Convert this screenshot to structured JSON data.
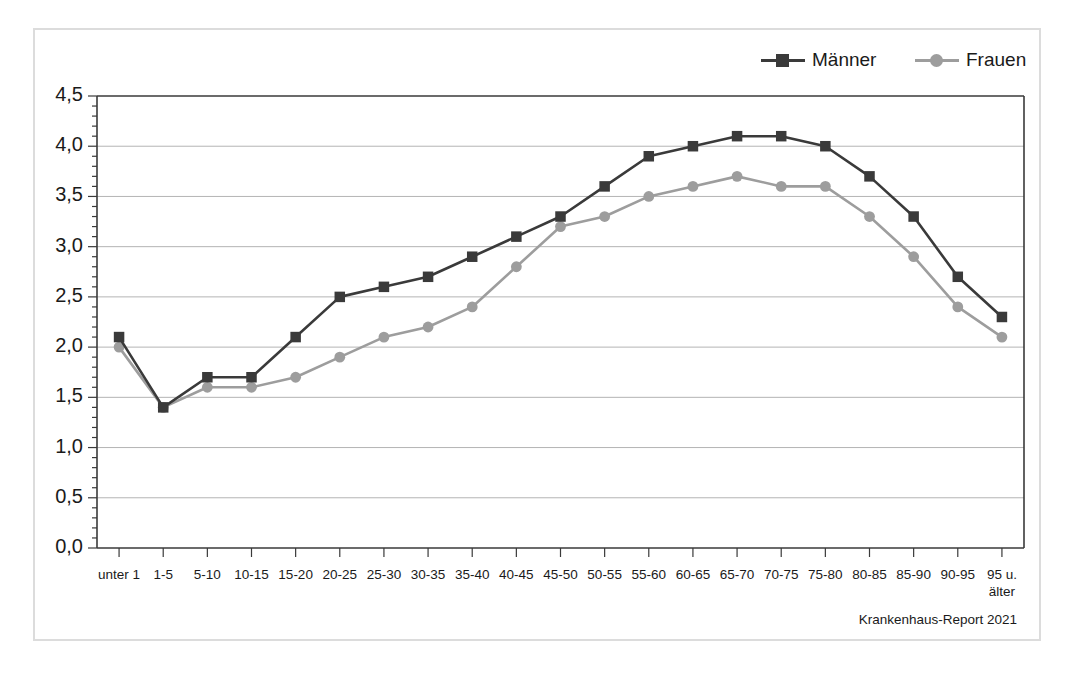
{
  "figure": {
    "source_note": "Krankenhaus-Report 2021"
  },
  "legend": {
    "entries": [
      {
        "label": "Männer",
        "color": "#3a3a3a",
        "marker": "square-marker"
      },
      {
        "label": "Frauen",
        "color": "#9d9d9d",
        "marker": "circle-marker"
      }
    ]
  },
  "chart_data": {
    "type": "line",
    "title": "",
    "subtitle": "",
    "xlabel": "",
    "ylabel": "",
    "ylim": [
      0.0,
      4.5
    ],
    "ytick_step": 0.5,
    "yticks": [
      "0,0",
      "0,5",
      "1,0",
      "1,5",
      "2,0",
      "2,5",
      "3,0",
      "3,5",
      "4,0",
      "4,5"
    ],
    "ytick_values": [
      0.0,
      0.5,
      1.0,
      1.5,
      2.0,
      2.5,
      3.0,
      3.5,
      4.0,
      4.5
    ],
    "grid": true,
    "grid_axis": "y",
    "legend_position": "top-right",
    "decimal_separator": ",",
    "categories": [
      "unter 1",
      "1-5",
      "5-10",
      "10-15",
      "15-20",
      "20-25",
      "25-30",
      "30-35",
      "35-40",
      "40-45",
      "45-50",
      "50-55",
      "55-60",
      "60-65",
      "65-70",
      "70-75",
      "75-80",
      "80-85",
      "85-90",
      "90-95",
      "95 u.\nälter"
    ],
    "series": [
      {
        "name": "Männer",
        "color": "#3a3a3a",
        "marker": "square",
        "values": [
          2.1,
          1.4,
          1.7,
          1.7,
          2.1,
          2.5,
          2.6,
          2.7,
          2.9,
          3.1,
          3.3,
          3.6,
          3.9,
          4.0,
          4.1,
          4.1,
          4.0,
          3.7,
          3.3,
          2.7,
          2.3
        ]
      },
      {
        "name": "Frauen",
        "color": "#9d9d9d",
        "marker": "circle",
        "values": [
          2.0,
          1.4,
          1.6,
          1.6,
          1.7,
          1.9,
          2.1,
          2.2,
          2.4,
          2.8,
          3.2,
          3.3,
          3.5,
          3.6,
          3.7,
          3.6,
          3.6,
          3.3,
          2.9,
          2.4,
          2.1
        ]
      }
    ]
  }
}
